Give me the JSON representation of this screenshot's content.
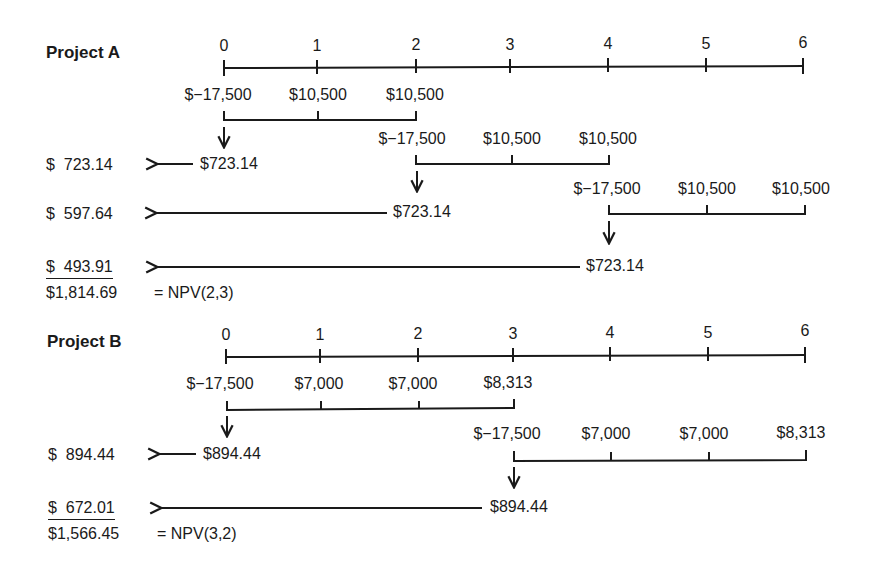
{
  "project_a": {
    "title": "Project A",
    "periods": [
      "0",
      "1",
      "2",
      "3",
      "4",
      "5",
      "6"
    ],
    "chains": [
      {
        "flows": [
          "$−17,500",
          "$10,500",
          "$10,500"
        ],
        "npv": "$723.14"
      },
      {
        "flows": [
          "$−17,500",
          "$10,500",
          "$10,500"
        ],
        "npv": "$723.14"
      },
      {
        "flows": [
          "$−17,500",
          "$10,500",
          "$10,500"
        ],
        "npv": "$723.14"
      }
    ],
    "discounted": [
      "$  723.14",
      "$  597.64",
      "$  493.91"
    ],
    "total": "$1,814.69",
    "total_label": "= NPV(2,3)"
  },
  "project_b": {
    "title": "Project B",
    "periods": [
      "0",
      "1",
      "2",
      "3",
      "4",
      "5",
      "6"
    ],
    "chains": [
      {
        "flows": [
          "$−17,500",
          "$7,000",
          "$7,000",
          "$8,313"
        ],
        "npv": "$894.44"
      },
      {
        "flows": [
          "$−17,500",
          "$7,000",
          "$7,000",
          "$8,313"
        ],
        "npv": "$894.44"
      }
    ],
    "discounted": [
      "$  894.44",
      "$  672.01"
    ],
    "total": "$1,566.45",
    "total_label": "= NPV(3,2)"
  }
}
